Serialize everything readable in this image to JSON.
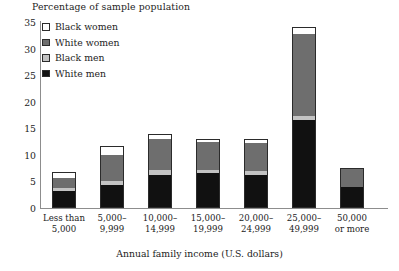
{
  "chart_data": {
    "type": "bar",
    "subtype": "stacked",
    "title": "Percentage of sample population",
    "xlabel": "Annual family income (U.S. dollars)",
    "ylabel": "Percentage of sample population",
    "grid": false,
    "legend_position": "top-left",
    "ylim": [
      0,
      35
    ],
    "yticks": [
      0,
      5,
      10,
      15,
      20,
      25,
      30,
      35
    ],
    "ytick_labels": [
      "0",
      "5",
      "10",
      "15",
      "20",
      "25",
      "30",
      "35"
    ],
    "categories": [
      "Less than 5,000",
      "5,000–9,999",
      "10,000–14,999",
      "15,000–19,999",
      "20,000–24,999",
      "25,000–49,999",
      "50,000 or more"
    ],
    "category_lines": [
      [
        "Less than",
        "5,000"
      ],
      [
        "5,000–",
        "9,999"
      ],
      [
        "10,000–",
        "14,999"
      ],
      [
        "15,000–",
        "19,999"
      ],
      [
        "20,000–",
        "24,999"
      ],
      [
        "25,000–",
        "49,999"
      ],
      [
        "50,000",
        "or more"
      ]
    ],
    "series": [
      {
        "name": "White men",
        "color": "#111111",
        "values": [
          3.2,
          4.3,
          6.3,
          6.5,
          6.3,
          16.6,
          4.0
        ]
      },
      {
        "name": "Black men",
        "color": "#c3c3c3",
        "values": [
          0.6,
          0.7,
          0.8,
          0.6,
          0.6,
          0.8,
          0.0
        ]
      },
      {
        "name": "White women",
        "color": "#6e6e6e",
        "values": [
          1.9,
          5.0,
          5.9,
          5.4,
          5.4,
          15.4,
          3.5
        ]
      },
      {
        "name": "Black women",
        "color": "#ffffff",
        "values": [
          1.0,
          1.6,
          1.0,
          0.5,
          0.7,
          1.2,
          0.0
        ]
      }
    ],
    "totals": [
      6.7,
      11.6,
      14.0,
      13.0,
      13.0,
      34.0,
      7.5
    ]
  },
  "legend": {
    "items": [
      {
        "label": "Black women",
        "color": "#ffffff"
      },
      {
        "label": "White women",
        "color": "#6e6e6e"
      },
      {
        "label": "Black men",
        "color": "#c3c3c3"
      },
      {
        "label": "White men",
        "color": "#111111"
      }
    ]
  },
  "axis_colors": {
    "axis_line": "#8d8d8d",
    "outline": "#2b2b2b",
    "text": "#1c1c1c"
  }
}
